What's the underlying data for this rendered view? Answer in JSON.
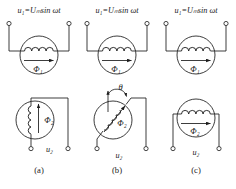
{
  "figure": {
    "type": "circuit-diagram",
    "panels": [
      {
        "caption": "(a)",
        "primary": {
          "source_label": "u₁=Uₘsin ωt",
          "flux_label": "Φ₁",
          "coil_orientation": "horizontal",
          "flux_direction": "right",
          "terminals": 2,
          "terminal_position": "top"
        },
        "secondary": {
          "output_label": "u₂",
          "flux_label": "Φ₂",
          "coil_orientation": "vertical",
          "flux_direction": "up",
          "terminals": 2,
          "terminal_position": "bottom",
          "angle_label": null
        }
      },
      {
        "caption": "(b)",
        "primary": {
          "source_label": "u₁=Uₘsin ωt",
          "flux_label": "Φ₁",
          "coil_orientation": "horizontal",
          "flux_direction": "right",
          "terminals": 2,
          "terminal_position": "top"
        },
        "secondary": {
          "output_label": "u₂",
          "flux_label": "Φ₂",
          "coil_orientation": "diagonal",
          "flux_direction": "up-right",
          "terminals": 2,
          "terminal_position": "bottom",
          "angle_label": "θ"
        }
      },
      {
        "caption": "(c)",
        "primary": {
          "source_label": "u₁=Uₘsin ωt",
          "flux_label": "Φ₁",
          "coil_orientation": "horizontal",
          "flux_direction": "right",
          "terminals": 2,
          "terminal_position": "top"
        },
        "secondary": {
          "output_label": "u₂",
          "flux_label": "Φ₂",
          "coil_orientation": "horizontal",
          "flux_direction": "right",
          "terminals": 2,
          "terminal_position": "bottom",
          "angle_label": null
        }
      }
    ],
    "colors": {
      "stroke": "#1a1a1a",
      "background": "#ffffff",
      "text": "#1a1a1a"
    }
  }
}
